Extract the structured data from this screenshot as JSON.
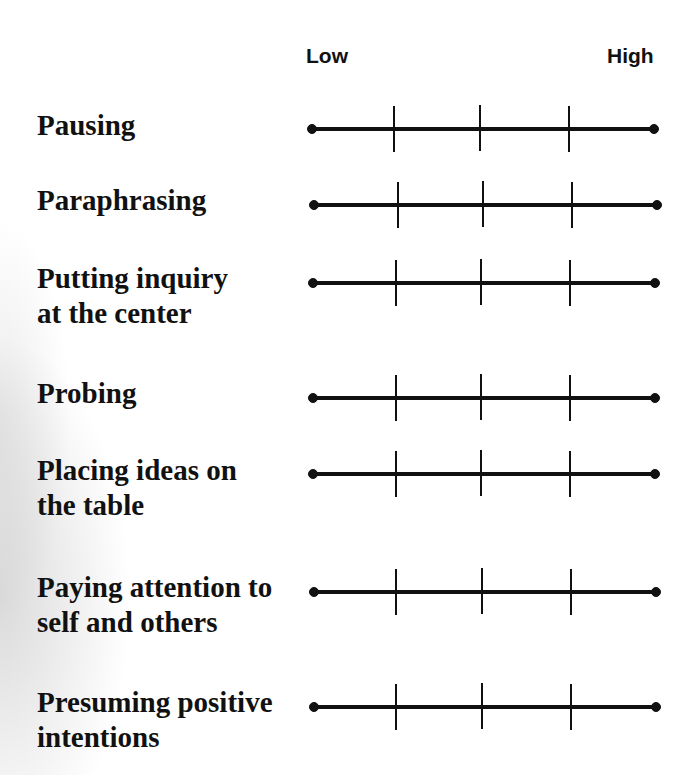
{
  "header": {
    "low_label": "Low",
    "high_label": "High"
  },
  "colors": {
    "line": "#111111",
    "text": "#111111",
    "background": "#ffffff"
  },
  "scale": {
    "points": 5,
    "endpoints": [
      "Low",
      "High"
    ],
    "interior_ticks": 3
  },
  "rows": [
    {
      "label": "Pausing"
    },
    {
      "label": "Paraphrasing"
    },
    {
      "label": "Putting inquiry\nat the center"
    },
    {
      "label": "Probing"
    },
    {
      "label": "Placing ideas on\nthe table"
    },
    {
      "label": "Paying attention to\nself and others"
    },
    {
      "label": "Presuming positive\nintentions"
    }
  ]
}
